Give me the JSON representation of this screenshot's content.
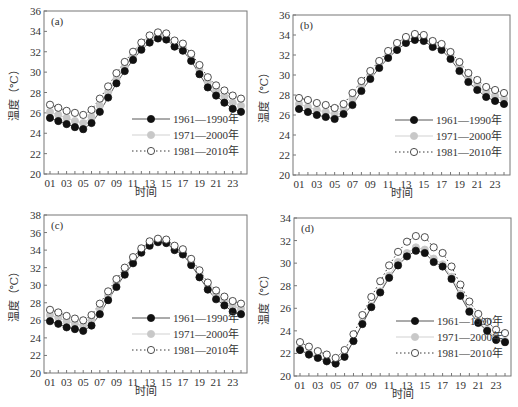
{
  "figure": {
    "x_ticks": [
      "01",
      "03",
      "05",
      "07",
      "09",
      "11",
      "13",
      "15",
      "17",
      "19",
      "21",
      "23"
    ],
    "xlabel": "时间",
    "ylabel": "温度（℃）",
    "legend": [
      {
        "label": "1961—1990年",
        "marker": "filled-black",
        "line": "solid"
      },
      {
        "label": "1971—2000年",
        "marker": "filled-gray",
        "line": "solid-light"
      },
      {
        "label": "1981—2010年",
        "marker": "open-circle",
        "line": "dotted"
      }
    ],
    "colors": {
      "series1": "#111111",
      "series2": "#c8c8c8",
      "series3": "#ffffff",
      "axis": "#555555",
      "line1": "#444444",
      "line2": "#cccccc",
      "line3": "#222222"
    }
  },
  "chart_data": [
    {
      "type": "line",
      "panel": "(a)",
      "xlabel": "时间",
      "ylabel": "温度（℃）",
      "ylim": [
        20,
        36
      ],
      "yticks": [
        20,
        22,
        24,
        26,
        28,
        30,
        32,
        34,
        36
      ],
      "x": [
        1,
        2,
        3,
        4,
        5,
        6,
        7,
        8,
        9,
        10,
        11,
        12,
        13,
        14,
        15,
        16,
        17,
        18,
        19,
        20,
        21,
        22,
        23,
        24
      ],
      "x_tick_labels": [
        "01",
        "03",
        "05",
        "07",
        "09",
        "11",
        "13",
        "15",
        "17",
        "19",
        "21",
        "23"
      ],
      "legend_position": "lower right",
      "series": [
        {
          "name": "1961—1990年",
          "values": [
            25.5,
            25.2,
            24.9,
            24.6,
            24.4,
            25.0,
            26.1,
            27.5,
            28.9,
            30.1,
            31.2,
            32.2,
            32.9,
            33.3,
            33.2,
            32.5,
            32.1,
            31.1,
            29.8,
            28.5,
            27.7,
            27.0,
            26.4,
            26.1
          ]
        },
        {
          "name": "1971—2000年",
          "values": [
            26.1,
            25.8,
            25.5,
            25.2,
            25.0,
            25.6,
            26.7,
            28.0,
            29.3,
            30.5,
            31.6,
            32.5,
            33.2,
            33.6,
            33.5,
            32.8,
            32.4,
            31.5,
            30.2,
            29.0,
            28.2,
            27.6,
            27.0,
            26.7
          ]
        },
        {
          "name": "1981—2010年",
          "values": [
            26.8,
            26.5,
            26.2,
            26.0,
            25.8,
            26.3,
            27.4,
            28.6,
            29.9,
            31.0,
            32.0,
            32.9,
            33.6,
            33.9,
            33.8,
            33.1,
            32.8,
            31.8,
            30.7,
            29.5,
            28.7,
            28.2,
            27.7,
            27.4
          ]
        }
      ]
    },
    {
      "type": "line",
      "panel": "(b)",
      "xlabel": "时间",
      "ylabel": "温度（℃）",
      "ylim": [
        20,
        36
      ],
      "yticks": [
        20,
        22,
        24,
        26,
        28,
        30,
        32,
        34,
        36
      ],
      "x": [
        1,
        2,
        3,
        4,
        5,
        6,
        7,
        8,
        9,
        10,
        11,
        12,
        13,
        14,
        15,
        16,
        17,
        18,
        19,
        20,
        21,
        22,
        23,
        24
      ],
      "x_tick_labels": [
        "01",
        "03",
        "05",
        "07",
        "09",
        "11",
        "13",
        "15",
        "17",
        "19",
        "21",
        "23"
      ],
      "legend_position": "lower right",
      "series": [
        {
          "name": "1961—1990年",
          "values": [
            26.6,
            26.3,
            26.0,
            25.8,
            25.6,
            26.1,
            27.0,
            28.4,
            29.6,
            30.7,
            31.7,
            32.5,
            33.2,
            33.5,
            33.4,
            32.8,
            32.5,
            31.6,
            30.4,
            29.3,
            28.5,
            27.8,
            27.4,
            27.1
          ]
        },
        {
          "name": "1971—2000年",
          "values": [
            27.1,
            26.8,
            26.5,
            26.3,
            26.1,
            26.6,
            27.6,
            28.9,
            30.0,
            31.1,
            32.0,
            32.9,
            33.5,
            33.8,
            33.7,
            33.1,
            32.8,
            32.0,
            30.8,
            29.7,
            28.9,
            28.3,
            27.9,
            27.6
          ]
        },
        {
          "name": "1981—2010年",
          "values": [
            27.7,
            27.5,
            27.2,
            27.0,
            26.7,
            27.1,
            28.2,
            29.4,
            30.4,
            31.4,
            32.4,
            33.2,
            33.8,
            34.1,
            34.0,
            33.4,
            33.1,
            32.3,
            31.3,
            30.2,
            29.5,
            28.8,
            28.5,
            28.2
          ]
        }
      ]
    },
    {
      "type": "line",
      "panel": "(c)",
      "xlabel": "时间",
      "ylabel": "温度（℃）",
      "ylim": [
        20,
        38
      ],
      "yticks": [
        20,
        22,
        24,
        26,
        28,
        30,
        32,
        34,
        36,
        38
      ],
      "x": [
        1,
        2,
        3,
        4,
        5,
        6,
        7,
        8,
        9,
        10,
        11,
        12,
        13,
        14,
        15,
        16,
        17,
        18,
        19,
        20,
        21,
        22,
        23,
        24
      ],
      "x_tick_labels": [
        "01",
        "03",
        "05",
        "07",
        "09",
        "11",
        "13",
        "15",
        "17",
        "19",
        "21",
        "23"
      ],
      "legend_position": "lower right",
      "series": [
        {
          "name": "1961—1990年",
          "values": [
            25.9,
            25.6,
            25.2,
            25.0,
            24.8,
            25.4,
            26.7,
            28.3,
            29.8,
            31.2,
            32.5,
            33.7,
            34.5,
            34.9,
            34.8,
            34.0,
            33.5,
            32.3,
            30.9,
            29.5,
            28.4,
            27.7,
            27.0,
            26.7
          ]
        },
        {
          "name": "1971—2000年",
          "values": [
            26.6,
            26.3,
            25.9,
            25.6,
            25.4,
            26.0,
            27.3,
            28.8,
            30.3,
            31.6,
            32.9,
            34.0,
            34.8,
            35.1,
            35.0,
            34.3,
            33.8,
            32.7,
            31.3,
            29.9,
            28.9,
            28.2,
            27.6,
            27.3
          ]
        },
        {
          "name": "1981—2010年",
          "values": [
            27.2,
            26.9,
            26.5,
            26.2,
            26.0,
            26.6,
            27.9,
            29.3,
            30.7,
            32.0,
            33.2,
            34.2,
            35.0,
            35.3,
            35.2,
            34.5,
            34.1,
            33.0,
            31.7,
            30.3,
            29.4,
            28.7,
            28.2,
            27.9
          ]
        }
      ]
    },
    {
      "type": "line",
      "panel": "(d)",
      "xlabel": "时间",
      "ylabel": "温度（℃）",
      "ylim": [
        20,
        34
      ],
      "yticks": [
        20,
        22,
        24,
        26,
        28,
        30,
        32,
        34
      ],
      "x": [
        1,
        2,
        3,
        4,
        5,
        6,
        7,
        8,
        9,
        10,
        11,
        12,
        13,
        14,
        15,
        16,
        17,
        18,
        19,
        20,
        21,
        22,
        23,
        24
      ],
      "x_tick_labels": [
        "01",
        "03",
        "05",
        "07",
        "09",
        "11",
        "13",
        "15",
        "17",
        "19",
        "21",
        "23"
      ],
      "legend_position": "lower right",
      "series": [
        {
          "name": "1961—1990年",
          "values": [
            22.3,
            21.9,
            21.6,
            21.3,
            21.1,
            21.7,
            23.1,
            24.6,
            26.1,
            27.4,
            28.7,
            29.8,
            30.6,
            31.1,
            30.9,
            30.1,
            29.7,
            28.6,
            27.1,
            25.7,
            24.7,
            24.0,
            23.2,
            23.0
          ]
        },
        {
          "name": "1971—2000年",
          "values": [
            22.4,
            22.0,
            21.7,
            21.4,
            21.1,
            21.8,
            23.1,
            24.7,
            26.2,
            27.5,
            28.9,
            30.1,
            30.9,
            31.4,
            31.2,
            30.4,
            29.9,
            28.8,
            27.3,
            25.8,
            24.8,
            24.1,
            23.4,
            23.1
          ]
        },
        {
          "name": "1981—2010年",
          "values": [
            23.0,
            22.6,
            22.2,
            21.9,
            21.6,
            22.3,
            23.7,
            25.4,
            27.0,
            28.4,
            29.8,
            31.0,
            31.9,
            32.4,
            32.3,
            31.4,
            30.9,
            29.7,
            28.1,
            26.6,
            25.5,
            24.8,
            24.1,
            23.8
          ]
        }
      ]
    }
  ],
  "panels": [
    {
      "label": "(a)"
    },
    {
      "label": "(b)"
    },
    {
      "label": "(c)"
    },
    {
      "label": "(d)"
    }
  ]
}
